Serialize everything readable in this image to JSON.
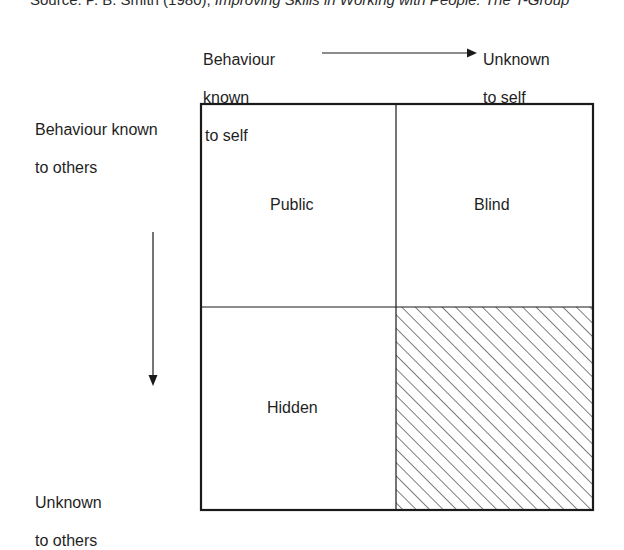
{
  "source": {
    "prefix": "Source: P. B. Smith (1980), ",
    "title": "Improving Skills in Working with People: The T-Group"
  },
  "axes": {
    "top_left_label": [
      "Behaviour",
      "known",
      "to self"
    ],
    "top_right_label": [
      "Unknown",
      "to self"
    ],
    "left_top_label": [
      "Behaviour known",
      "to others"
    ],
    "left_bottom_label": [
      "Unknown",
      "to others"
    ]
  },
  "quadrants": {
    "top_left": "Public",
    "top_right": "Blind",
    "bottom_left": "Hidden",
    "bottom_right": ""
  },
  "colors": {
    "line": "#1a1a1a",
    "hatch": "#3a3a3a",
    "background": "#ffffff"
  }
}
